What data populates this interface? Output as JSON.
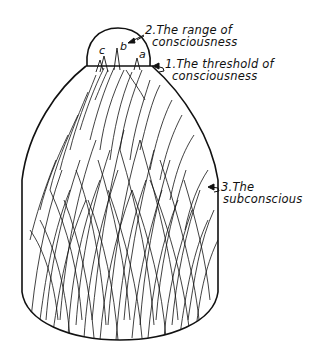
{
  "diagram": {
    "colors": {
      "ink": "#111111",
      "background": "#ffffff"
    },
    "labels": [
      {
        "id": "range",
        "number": "2.",
        "line1": "The range of",
        "line2": "consciousness"
      },
      {
        "id": "threshold",
        "number": "1.",
        "line1": "The threshold of",
        "line2": "consciousness"
      },
      {
        "id": "subconscious",
        "number": "3.",
        "line1": "The",
        "line2": "subconscious"
      }
    ],
    "peak_letters": [
      "c",
      "b",
      "a"
    ]
  }
}
